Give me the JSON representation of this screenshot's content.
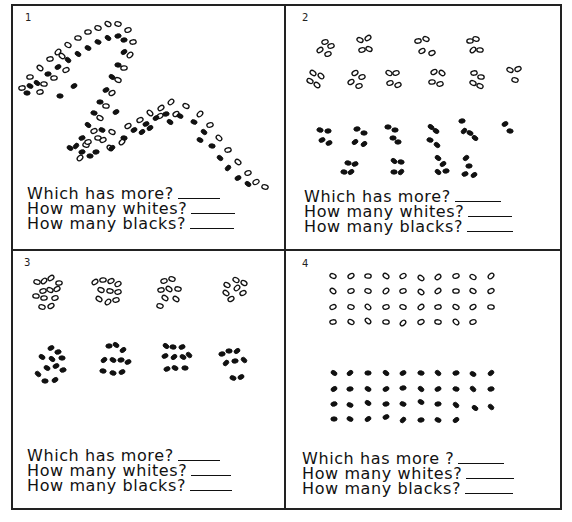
{
  "worksheet": {
    "colors": {
      "ink": "#111111",
      "paper": "#ffffff",
      "border": "#222222"
    },
    "panels": [
      {
        "number": "1",
        "layout": "snake",
        "counts": {
          "whites": 49,
          "blacks": 47
        },
        "questions": [
          "Which has more?",
          "How many whites?",
          "How many blacks?"
        ]
      },
      {
        "number": "2",
        "layout": "groups",
        "counts": {
          "whites": 39,
          "blacks": 38,
          "white_groups": "9 groups of 4 + 1 group of 3",
          "black_groups": "9 groups of 4 + 1 group of 2"
        },
        "questions": [
          "Which has more?",
          "How many whites?",
          "How many blacks?"
        ]
      },
      {
        "number": "3",
        "layout": "clusters",
        "counts": {
          "whites": 39,
          "blacks": 38
        },
        "questions": [
          "Which has more?",
          "How many whites?",
          "How many blacks?"
        ]
      },
      {
        "number": "4",
        "layout": "rows",
        "counts": {
          "whites": 39,
          "blacks": 38,
          "white_rows": [
            10,
            10,
            10,
            9
          ],
          "black_rows": [
            10,
            10,
            10,
            8
          ]
        },
        "questions": [
          "Which has more ?",
          "How many whites?",
          "How many blacks?"
        ]
      }
    ]
  },
  "dots": {
    "p1": {
      "white": [
        [
          22,
          88
        ],
        [
          30,
          77
        ],
        [
          40,
          68
        ],
        [
          50,
          59
        ],
        [
          58,
          52
        ],
        [
          68,
          45
        ],
        [
          78,
          38
        ],
        [
          88,
          32
        ],
        [
          98,
          28
        ],
        [
          108,
          24
        ],
        [
          118,
          24
        ],
        [
          128,
          30
        ],
        [
          133,
          42
        ],
        [
          130,
          55
        ],
        [
          124,
          68
        ],
        [
          118,
          80
        ],
        [
          112,
          93
        ],
        [
          106,
          106
        ],
        [
          100,
          118
        ],
        [
          94,
          131
        ],
        [
          86,
          145
        ],
        [
          80,
          158
        ],
        [
          88,
          142
        ],
        [
          98,
          138
        ],
        [
          112,
          132
        ],
        [
          128,
          126
        ],
        [
          140,
          120
        ],
        [
          150,
          113
        ],
        [
          161,
          108
        ],
        [
          171,
          102
        ],
        [
          186,
          106
        ],
        [
          200,
          114
        ],
        [
          210,
          125
        ],
        [
          219,
          138
        ],
        [
          228,
          150
        ],
        [
          238,
          162
        ],
        [
          248,
          173
        ],
        [
          256,
          182
        ],
        [
          265,
          187
        ],
        [
          44,
          84
        ],
        [
          54,
          78
        ],
        [
          66,
          70
        ],
        [
          110,
          148
        ],
        [
          122,
          142
        ],
        [
          160,
          116
        ],
        [
          176,
          114
        ],
        [
          40,
          92
        ],
        [
          62,
          56
        ],
        [
          103,
          140
        ]
      ],
      "black": [
        [
          27,
          93
        ],
        [
          37,
          83
        ],
        [
          48,
          74
        ],
        [
          58,
          67
        ],
        [
          68,
          60
        ],
        [
          78,
          54
        ],
        [
          88,
          48
        ],
        [
          98,
          42
        ],
        [
          108,
          38
        ],
        [
          118,
          36
        ],
        [
          124,
          40
        ],
        [
          124,
          52
        ],
        [
          118,
          65
        ],
        [
          112,
          77
        ],
        [
          106,
          90
        ],
        [
          100,
          102
        ],
        [
          94,
          113
        ],
        [
          88,
          125
        ],
        [
          82,
          138
        ],
        [
          76,
          146
        ],
        [
          82,
          152
        ],
        [
          96,
          152
        ],
        [
          112,
          148
        ],
        [
          124,
          138
        ],
        [
          134,
          130
        ],
        [
          146,
          124
        ],
        [
          156,
          118
        ],
        [
          166,
          114
        ],
        [
          180,
          116
        ],
        [
          194,
          122
        ],
        [
          204,
          132
        ],
        [
          212,
          146
        ],
        [
          220,
          158
        ],
        [
          228,
          168
        ],
        [
          238,
          178
        ],
        [
          248,
          184
        ],
        [
          70,
          148
        ],
        [
          90,
          156
        ],
        [
          142,
          132
        ],
        [
          116,
          112
        ],
        [
          60,
          96
        ],
        [
          102,
          130
        ],
        [
          74,
          86
        ],
        [
          200,
          140
        ],
        [
          150,
          128
        ],
        [
          30,
          86
        ],
        [
          170,
          122
        ]
      ]
    },
    "p2": {
      "white": [
        [
          325,
          42
        ],
        [
          331,
          46
        ],
        [
          320,
          50
        ],
        [
          328,
          54
        ],
        [
          360,
          40
        ],
        [
          368,
          38
        ],
        [
          362,
          50
        ],
        [
          369,
          49
        ],
        [
          418,
          41
        ],
        [
          426,
          39
        ],
        [
          422,
          51
        ],
        [
          432,
          53
        ],
        [
          470,
          41
        ],
        [
          476,
          39
        ],
        [
          473,
          50
        ],
        [
          480,
          50
        ],
        [
          313,
          73
        ],
        [
          321,
          76
        ],
        [
          310,
          81
        ],
        [
          317,
          85
        ],
        [
          355,
          73
        ],
        [
          362,
          77
        ],
        [
          351,
          82
        ],
        [
          359,
          86
        ],
        [
          389,
          73
        ],
        [
          396,
          73
        ],
        [
          390,
          83
        ],
        [
          398,
          85
        ],
        [
          434,
          72
        ],
        [
          442,
          73
        ],
        [
          432,
          82
        ],
        [
          440,
          84
        ],
        [
          474,
          73
        ],
        [
          481,
          77
        ],
        [
          473,
          83
        ],
        [
          480,
          86
        ],
        [
          510,
          70
        ],
        [
          518,
          69
        ],
        [
          515,
          80
        ]
      ],
      "black": [
        [
          320,
          130
        ],
        [
          328,
          131
        ],
        [
          322,
          140
        ],
        [
          329,
          143
        ],
        [
          357,
          129
        ],
        [
          364,
          133
        ],
        [
          355,
          142
        ],
        [
          364,
          144
        ],
        [
          388,
          127
        ],
        [
          395,
          130
        ],
        [
          393,
          138
        ],
        [
          398,
          142
        ],
        [
          431,
          127
        ],
        [
          436,
          131
        ],
        [
          430,
          140
        ],
        [
          437,
          145
        ],
        [
          462,
          121
        ],
        [
          464,
          131
        ],
        [
          470,
          133
        ],
        [
          475,
          138
        ],
        [
          505,
          124
        ],
        [
          510,
          131
        ],
        [
          348,
          163
        ],
        [
          355,
          164
        ],
        [
          344,
          172
        ],
        [
          351,
          172
        ],
        [
          394,
          161
        ],
        [
          401,
          162
        ],
        [
          394,
          172
        ],
        [
          401,
          172
        ],
        [
          438,
          158
        ],
        [
          443,
          164
        ],
        [
          438,
          172
        ],
        [
          446,
          171
        ],
        [
          466,
          158
        ],
        [
          469,
          166
        ],
        [
          465,
          174
        ],
        [
          474,
          175
        ]
      ]
    },
    "p3": {
      "white": [
        [
          37,
          282
        ],
        [
          44,
          281
        ],
        [
          51,
          278
        ],
        [
          59,
          283
        ],
        [
          43,
          291
        ],
        [
          50,
          290
        ],
        [
          57,
          289
        ],
        [
          36,
          296
        ],
        [
          44,
          298
        ],
        [
          55,
          298
        ],
        [
          42,
          307
        ],
        [
          51,
          306
        ],
        [
          95,
          282
        ],
        [
          103,
          280
        ],
        [
          111,
          281
        ],
        [
          118,
          284
        ],
        [
          101,
          290
        ],
        [
          110,
          291
        ],
        [
          118,
          292
        ],
        [
          99,
          299
        ],
        [
          108,
          302
        ],
        [
          116,
          300
        ],
        [
          164,
          281
        ],
        [
          172,
          279
        ],
        [
          161,
          290
        ],
        [
          169,
          289
        ],
        [
          178,
          289
        ],
        [
          165,
          298
        ],
        [
          176,
          299
        ],
        [
          160,
          306
        ],
        [
          227,
          285
        ],
        [
          236,
          280
        ],
        [
          244,
          283
        ],
        [
          237,
          288
        ],
        [
          226,
          293
        ],
        [
          243,
          293
        ],
        [
          231,
          299
        ]
      ],
      "black": [
        [
          51,
          348
        ],
        [
          58,
          352
        ],
        [
          42,
          357
        ],
        [
          52,
          359
        ],
        [
          62,
          358
        ],
        [
          47,
          368
        ],
        [
          56,
          366
        ],
        [
          63,
          370
        ],
        [
          38,
          374
        ],
        [
          45,
          381
        ],
        [
          55,
          380
        ],
        [
          109,
          346
        ],
        [
          116,
          345
        ],
        [
          123,
          350
        ],
        [
          104,
          360
        ],
        [
          113,
          360
        ],
        [
          121,
          360
        ],
        [
          128,
          362
        ],
        [
          103,
          371
        ],
        [
          113,
          373
        ],
        [
          122,
          372
        ],
        [
          166,
          346
        ],
        [
          173,
          347
        ],
        [
          182,
          347
        ],
        [
          165,
          356
        ],
        [
          174,
          357
        ],
        [
          183,
          357
        ],
        [
          189,
          355
        ],
        [
          167,
          369
        ],
        [
          175,
          368
        ],
        [
          185,
          368
        ],
        [
          222,
          354
        ],
        [
          229,
          351
        ],
        [
          237,
          351
        ],
        [
          226,
          363
        ],
        [
          235,
          361
        ],
        [
          244,
          360
        ],
        [
          233,
          378
        ],
        [
          241,
          377
        ]
      ]
    },
    "p4": {
      "white": [
        [
          333,
          276
        ],
        [
          351,
          276
        ],
        [
          368,
          276
        ],
        [
          386,
          276
        ],
        [
          403,
          276
        ],
        [
          421,
          278
        ],
        [
          438,
          277
        ],
        [
          456,
          276
        ],
        [
          473,
          277
        ],
        [
          491,
          276
        ],
        [
          333,
          291
        ],
        [
          351,
          291
        ],
        [
          368,
          291
        ],
        [
          386,
          291
        ],
        [
          403,
          291
        ],
        [
          421,
          292
        ],
        [
          438,
          291
        ],
        [
          456,
          291
        ],
        [
          473,
          291
        ],
        [
          491,
          291
        ],
        [
          333,
          307
        ],
        [
          351,
          307
        ],
        [
          368,
          307
        ],
        [
          386,
          307
        ],
        [
          403,
          307
        ],
        [
          421,
          307
        ],
        [
          438,
          307
        ],
        [
          456,
          307
        ],
        [
          473,
          307
        ],
        [
          491,
          307
        ],
        [
          333,
          322
        ],
        [
          351,
          322
        ],
        [
          368,
          321
        ],
        [
          386,
          322
        ],
        [
          403,
          323
        ],
        [
          421,
          322
        ],
        [
          438,
          322
        ],
        [
          456,
          322
        ],
        [
          473,
          322
        ]
      ],
      "black": [
        [
          334,
          373
        ],
        [
          350,
          373
        ],
        [
          368,
          373
        ],
        [
          386,
          373
        ],
        [
          403,
          373
        ],
        [
          421,
          373
        ],
        [
          438,
          373
        ],
        [
          456,
          373
        ],
        [
          473,
          374
        ],
        [
          491,
          373
        ],
        [
          334,
          389
        ],
        [
          350,
          389
        ],
        [
          368,
          389
        ],
        [
          386,
          389
        ],
        [
          403,
          388
        ],
        [
          421,
          389
        ],
        [
          438,
          389
        ],
        [
          456,
          389
        ],
        [
          473,
          389
        ],
        [
          491,
          389
        ],
        [
          334,
          404
        ],
        [
          350,
          405
        ],
        [
          368,
          403
        ],
        [
          386,
          404
        ],
        [
          403,
          404
        ],
        [
          421,
          402
        ],
        [
          438,
          404
        ],
        [
          456,
          405
        ],
        [
          475,
          408
        ],
        [
          491,
          407
        ],
        [
          334,
          419
        ],
        [
          350,
          419
        ],
        [
          368,
          419
        ],
        [
          386,
          417
        ],
        [
          403,
          420
        ],
        [
          421,
          420
        ],
        [
          438,
          420
        ],
        [
          456,
          420
        ]
      ]
    }
  }
}
